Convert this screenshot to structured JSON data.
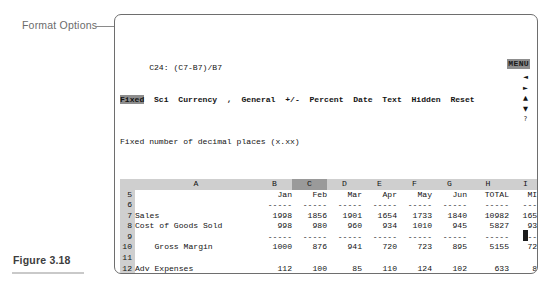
{
  "annotations": {
    "format_options_label": "Format Options",
    "figure_caption": "Figure 3.18"
  },
  "screen": {
    "menu_indicator": "MENU",
    "cell_reference": "C24: (C7-B7)/B7",
    "menu_items": [
      {
        "label": "Fixed",
        "selected": true
      },
      {
        "label": "Sci",
        "selected": false
      },
      {
        "label": "Currency",
        "selected": false
      },
      {
        "label": ",",
        "selected": false
      },
      {
        "label": "General",
        "selected": false
      },
      {
        "label": "+/-",
        "selected": false
      },
      {
        "label": "Percent",
        "selected": false
      },
      {
        "label": "Date",
        "selected": false
      },
      {
        "label": "Text",
        "selected": false
      },
      {
        "label": "Hidden",
        "selected": false
      },
      {
        "label": "Reset",
        "selected": false
      }
    ],
    "help_line": "Fixed number of decimal places (x.xx)",
    "status_filename": "COMPLETE.WK1",
    "nav_arrows": [
      "◄",
      "►",
      "▲",
      "▼",
      "?"
    ],
    "column_letters": [
      "A",
      "B",
      "C",
      "D",
      "E",
      "F",
      "G",
      "H",
      "I",
      "J"
    ],
    "selected_column": "C",
    "selected_row": "24"
  },
  "chart_data": {
    "type": "table",
    "columns": [
      "A",
      "B",
      "C",
      "D",
      "E",
      "F",
      "G",
      "H",
      "I",
      "J"
    ],
    "headers": [
      "",
      "Jan",
      "Feb",
      "Mar",
      "Apr",
      "May",
      "Jun",
      "TOTAL",
      "MIN",
      "MAX"
    ],
    "rows": [
      {
        "n": "5",
        "label": "",
        "jan": "Jan",
        "feb": "Feb",
        "mar": "Mar",
        "apr": "Apr",
        "may": "May",
        "jun": "Jun",
        "total": "TOTAL",
        "min": "MIN",
        "max": "MAX",
        "style": "header"
      },
      {
        "n": "6",
        "label": "",
        "jan": "-----",
        "feb": "-----",
        "mar": "-----",
        "apr": "-----",
        "may": "-----",
        "jun": "-----",
        "total": "-----",
        "min": "----",
        "max": "------",
        "style": "rule"
      },
      {
        "n": "7",
        "label": "Sales",
        "jan": "1998",
        "feb": "1856",
        "mar": "1901",
        "apr": "1654",
        "may": "1733",
        "jun": "1840",
        "total": "10982",
        "min": "1654",
        "max": "1998",
        "style": "data"
      },
      {
        "n": "8",
        "label": "Cost of Goods Sold",
        "jan": "998",
        "feb": "980",
        "mar": "960",
        "apr": "934",
        "may": "1010",
        "jun": "945",
        "total": "5827",
        "min": "934",
        "max": "1010",
        "style": "data"
      },
      {
        "n": "9",
        "label": "",
        "jan": "-----",
        "feb": "-----",
        "mar": "-----",
        "apr": "-----",
        "may": "-----",
        "jun": "-----",
        "total": "-----",
        "min": "----",
        "max": "------",
        "style": "rule"
      },
      {
        "n": "10",
        "label": "    Gross Margin",
        "jan": "1000",
        "feb": "876",
        "mar": "941",
        "apr": "720",
        "may": "723",
        "jun": "895",
        "total": "5155",
        "min": "720",
        "max": "1000",
        "style": "data"
      },
      {
        "n": "11",
        "label": "",
        "jan": "",
        "feb": "",
        "mar": "",
        "apr": "",
        "may": "",
        "jun": "",
        "total": "",
        "min": "",
        "max": "",
        "style": "blank"
      },
      {
        "n": "12",
        "label": "Adv Expenses",
        "jan": "112",
        "feb": "100",
        "mar": "85",
        "apr": "110",
        "may": "124",
        "jun": "102",
        "total": "633",
        "min": "85",
        "max": "124",
        "style": "data"
      },
      {
        "n": "13",
        "label": "Opr Expenses",
        "jan": "79",
        "feb": "88",
        "mar": "74",
        "apr": "88",
        "may": "95",
        "jun": "99",
        "total": "523",
        "min": "74",
        "max": "99",
        "style": "data"
      },
      {
        "n": "14",
        "label": "Misc Expenses",
        "jan": "36",
        "feb": "42",
        "mar": "31",
        "apr": "34",
        "may": "22",
        "jun": "36",
        "total": "201",
        "min": "22",
        "max": "42",
        "style": "data"
      },
      {
        "n": "15",
        "label": "",
        "jan": "-----",
        "feb": "-----",
        "mar": "-----",
        "apr": "-----",
        "may": "-----",
        "jun": "-----",
        "total": "-----",
        "min": "----",
        "max": "-----",
        "style": "rule"
      },
      {
        "n": "16",
        "label": "    Total Expenses",
        "jan": "227",
        "feb": "230",
        "mar": "190",
        "apr": "232",
        "may": "241",
        "jun": "237",
        "total": "1357",
        "min": "190",
        "max": "241",
        "style": "data"
      },
      {
        "n": "17",
        "label": "    Average Expense",
        "jan": "76",
        "feb": "77",
        "mar": "63",
        "apr": "77",
        "may": "80",
        "jun": "79",
        "total": "452",
        "min": "63",
        "max": "80",
        "style": "data"
      },
      {
        "n": "18",
        "label": "",
        "jan": "",
        "feb": "",
        "mar": "",
        "apr": "",
        "may": "",
        "jun": "",
        "total": "",
        "min": "",
        "max": "",
        "style": "blank"
      },
      {
        "n": "19",
        "label": "Net Before Tax",
        "jan": "773",
        "feb": "646",
        "mar": "751",
        "apr": "488",
        "may": "482",
        "jun": "658",
        "total": "3798",
        "min": "482",
        "max": "773",
        "style": "data"
      },
      {
        "n": "20",
        "label": "Federal Taxes",
        "jan": "402",
        "feb": "336",
        "mar": "391",
        "apr": "254",
        "may": "251",
        "jun": "342",
        "total": "1975",
        "min": "251",
        "max": "402",
        "style": "data"
      },
      {
        "n": "21",
        "label": "",
        "jan": "",
        "feb": "",
        "mar": "",
        "apr": "",
        "may": "",
        "jun": "",
        "total": "",
        "min": "",
        "max": "",
        "style": "dashrule"
      },
      {
        "n": "22",
        "label": "    Net After Tax",
        "jan": "371",
        "feb": "310",
        "mar": "360",
        "apr": "234",
        "may": "231",
        "jun": "316",
        "total": "1823",
        "min": "231",
        "max": "371",
        "style": "data"
      },
      {
        "n": "23",
        "label": "",
        "jan": "",
        "feb": "",
        "mar": "",
        "apr": "",
        "may": "",
        "jun": "",
        "total": "",
        "min": "",
        "max": "",
        "style": "dblrule"
      },
      {
        "n": "24",
        "label": "    % Sales Increase",
        "jan": "",
        "feb": "0",
        "mar": "",
        "apr": "",
        "may": "",
        "jun": "",
        "total": "",
        "min": "",
        "max": "",
        "style": "cursor"
      }
    ]
  }
}
